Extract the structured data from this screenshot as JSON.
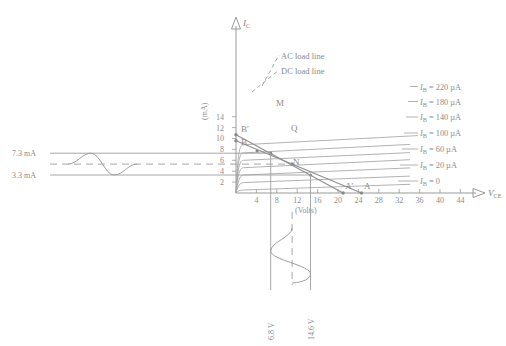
{
  "figure": {
    "type": "transistor-output-characteristics",
    "axes": {
      "y_title": "I_C",
      "y_unit": "(mA)",
      "y_ticks": [
        2,
        4,
        6,
        8,
        10,
        12,
        14
      ],
      "y_min": 0,
      "y_max": 15.5,
      "x_title": "V_CE",
      "x_unit": "(Volts)",
      "x_ticks": [
        4,
        8,
        12,
        16,
        20,
        24,
        28,
        32,
        36,
        40,
        44
      ],
      "x_min": 0,
      "x_max": 47
    },
    "annotations": {
      "ac_load_line_label": "AC load line",
      "dc_load_line_label": "DC load line",
      "point_b_prime": "B′",
      "point_b": "B",
      "point_m": "M",
      "point_q": "Q",
      "point_n": "N",
      "point_a_prime": "A′",
      "point_a": "A"
    },
    "ib_curves": [
      {
        "label": "I_B = 220 µA",
        "ib_ua": 220,
        "ic_knee": 8.85,
        "ic_right": 10.7
      },
      {
        "label": "I_B = 180 µA",
        "ib_ua": 180,
        "ic_knee": 7.35,
        "ic_right": 9.1
      },
      {
        "label": "I_B = 140 µA",
        "ib_ua": 140,
        "ic_knee": 6.0,
        "ic_right": 7.6
      },
      {
        "label": "I_B = 100 µA",
        "ib_ua": 100,
        "ic_knee": 4.65,
        "ic_right": 6.1
      },
      {
        "label": "I_B = 60 µA",
        "ib_ua": 60,
        "ic_knee": 3.3,
        "ic_right": 4.6
      },
      {
        "label": "I_B = 20 µA",
        "ib_ua": 20,
        "ic_knee": 1.9,
        "ic_right": 3.1
      },
      {
        "label": "I_B = 0",
        "ib_ua": 0,
        "ic_knee": 0.55,
        "ic_right": 1.6
      }
    ],
    "load_lines": {
      "dc": {
        "from": {
          "v": 0,
          "i": 9.6
        },
        "to": {
          "v": 24.6,
          "i": 0
        }
      },
      "ac": {
        "from": {
          "v": 0,
          "i": 10.7
        },
        "to": {
          "v": 21.0,
          "i": 0
        }
      }
    },
    "q_point": {
      "v": 11.0,
      "i": 5.3
    },
    "m_point": {
      "v": 6.8,
      "i": 7.3
    },
    "n_point": {
      "v": 14.6,
      "i": 3.3
    },
    "current_waveform": {
      "upper_label": "7.3 mA",
      "upper_value": 7.3,
      "lower_label": "3.3 mA",
      "lower_value": 3.3,
      "center_value": 5.3
    },
    "voltage_waveform": {
      "left_label": "6.8 V",
      "left_value": 6.8,
      "right_label": "14.6 V",
      "right_value": 14.6,
      "center_value": 11.0
    }
  }
}
